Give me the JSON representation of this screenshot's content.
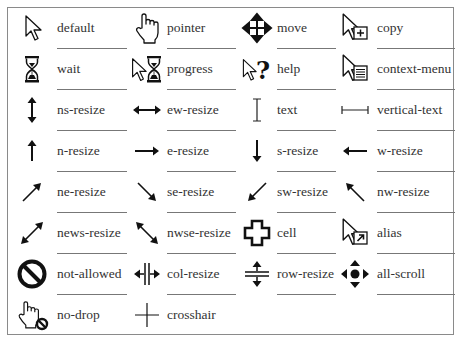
{
  "colors": {
    "text": "#333333",
    "icon": "#111111",
    "border": "#8a8a8a"
  },
  "cursors": [
    {
      "label": "default",
      "icon": "arrow-pointer-icon"
    },
    {
      "label": "pointer",
      "icon": "hand-pointer-icon"
    },
    {
      "label": "move",
      "icon": "move-arrows-icon"
    },
    {
      "label": "copy",
      "icon": "arrow-copy-icon"
    },
    {
      "label": "wait",
      "icon": "hourglass-icon"
    },
    {
      "label": "progress",
      "icon": "arrow-hourglass-icon"
    },
    {
      "label": "help",
      "icon": "arrow-question-icon"
    },
    {
      "label": "context-menu",
      "icon": "arrow-menu-icon"
    },
    {
      "label": "ns-resize",
      "icon": "ns-arrow-icon"
    },
    {
      "label": "ew-resize",
      "icon": "ew-arrow-icon"
    },
    {
      "label": "text",
      "icon": "i-beam-icon"
    },
    {
      "label": "vertical-text",
      "icon": "horizontal-i-beam-icon"
    },
    {
      "label": "n-resize",
      "icon": "arrow-up-icon"
    },
    {
      "label": "e-resize",
      "icon": "arrow-right-icon"
    },
    {
      "label": "s-resize",
      "icon": "arrow-down-icon"
    },
    {
      "label": "w-resize",
      "icon": "arrow-left-icon"
    },
    {
      "label": "ne-resize",
      "icon": "arrow-ne-icon"
    },
    {
      "label": "se-resize",
      "icon": "arrow-se-icon"
    },
    {
      "label": "sw-resize",
      "icon": "arrow-sw-icon"
    },
    {
      "label": "nw-resize",
      "icon": "arrow-nw-icon"
    },
    {
      "label": "news-resize",
      "icon": "nesw-arrow-icon"
    },
    {
      "label": "nwse-resize",
      "icon": "nwse-arrow-icon"
    },
    {
      "label": "cell",
      "icon": "thick-cross-icon"
    },
    {
      "label": "alias",
      "icon": "arrow-shortcut-icon"
    },
    {
      "label": "not-allowed",
      "icon": "no-entry-icon"
    },
    {
      "label": "col-resize",
      "icon": "col-resize-icon"
    },
    {
      "label": "row-resize",
      "icon": "row-resize-icon"
    },
    {
      "label": "all-scroll",
      "icon": "all-scroll-icon"
    },
    {
      "label": "no-drop",
      "icon": "hand-no-drop-icon"
    },
    {
      "label": "crosshair",
      "icon": "crosshair-icon"
    }
  ]
}
